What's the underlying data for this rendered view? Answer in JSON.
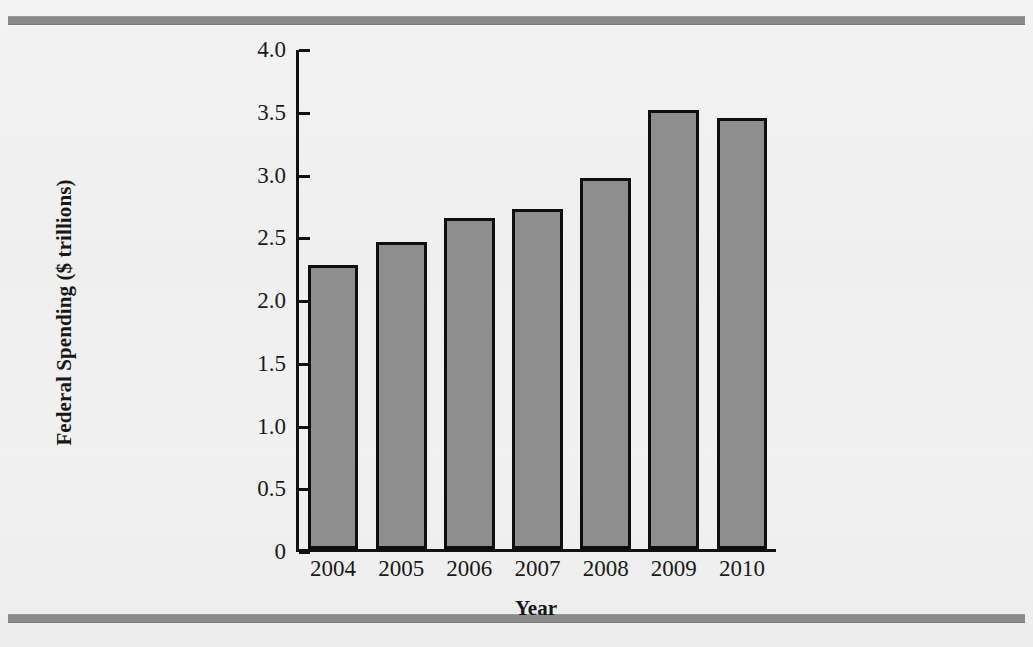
{
  "figure": {
    "background_color": "#f1f1f1",
    "rule_color": "#8a8a8a",
    "bar_fill_color": "#8e8e8e",
    "bar_border_color": "#0f0f0f",
    "axis_color": "#111111"
  },
  "chart_data": {
    "type": "bar",
    "title": "",
    "xlabel": "Year",
    "ylabel": "Federal Spending ($ trillions)",
    "categories": [
      "2004",
      "2005",
      "2006",
      "2007",
      "2008",
      "2009",
      "2010"
    ],
    "values": [
      2.29,
      2.47,
      2.66,
      2.73,
      2.98,
      3.52,
      3.46
    ],
    "ylim": [
      0,
      4.0
    ],
    "yticks": [
      0,
      0.5,
      1.0,
      1.5,
      2.0,
      2.5,
      3.0,
      3.5,
      4.0
    ],
    "ytick_labels": [
      "0",
      "0.5",
      "1.0",
      "1.5",
      "2.0",
      "2.5",
      "3.0",
      "3.5",
      "4.0"
    ],
    "grid": false,
    "legend": null,
    "series": [
      {
        "name": "Federal Spending",
        "values": [
          2.29,
          2.47,
          2.66,
          2.73,
          2.98,
          3.52,
          3.46
        ]
      }
    ]
  }
}
